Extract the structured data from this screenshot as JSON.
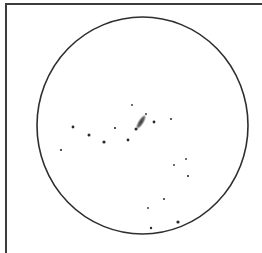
{
  "sketch": {
    "kind": "telescope eyepiece drawing",
    "width": 262,
    "height": 253,
    "background": "#ffffff",
    "ink_color": "#2a2a2a",
    "frame": {
      "color": "#3c3c3c",
      "stroke_width": 2,
      "top_y": 4,
      "left_x": 6
    },
    "field_of_view": {
      "cx": 142.5,
      "cy": 125.5,
      "rx": 105.5,
      "ry": 108.5,
      "stroke": "#2e2e2e",
      "stroke_width": 1.6
    },
    "galaxy": {
      "cx": 141,
      "cy": 122,
      "length": 19,
      "width": 5,
      "angle_deg": -58,
      "color": "#555555",
      "core_color": "#333333"
    },
    "stars": [
      {
        "x": 132,
        "y": 105,
        "r": 0.9
      },
      {
        "x": 146,
        "y": 114,
        "r": 0.9
      },
      {
        "x": 136,
        "y": 129,
        "r": 1.5
      },
      {
        "x": 154,
        "y": 122,
        "r": 1.4
      },
      {
        "x": 171,
        "y": 119,
        "r": 1.0
      },
      {
        "x": 73,
        "y": 127,
        "r": 1.4
      },
      {
        "x": 89,
        "y": 135,
        "r": 1.5
      },
      {
        "x": 104,
        "y": 142,
        "r": 1.6
      },
      {
        "x": 115,
        "y": 128,
        "r": 1.1
      },
      {
        "x": 128,
        "y": 140,
        "r": 1.4
      },
      {
        "x": 61,
        "y": 150,
        "r": 1.1
      },
      {
        "x": 174,
        "y": 165,
        "r": 0.9
      },
      {
        "x": 186,
        "y": 159,
        "r": 0.9
      },
      {
        "x": 188,
        "y": 176,
        "r": 1.1
      },
      {
        "x": 164,
        "y": 199,
        "r": 1.0
      },
      {
        "x": 148,
        "y": 208,
        "r": 0.9
      },
      {
        "x": 178,
        "y": 222,
        "r": 1.6
      },
      {
        "x": 151,
        "y": 228,
        "r": 1.2
      }
    ]
  }
}
